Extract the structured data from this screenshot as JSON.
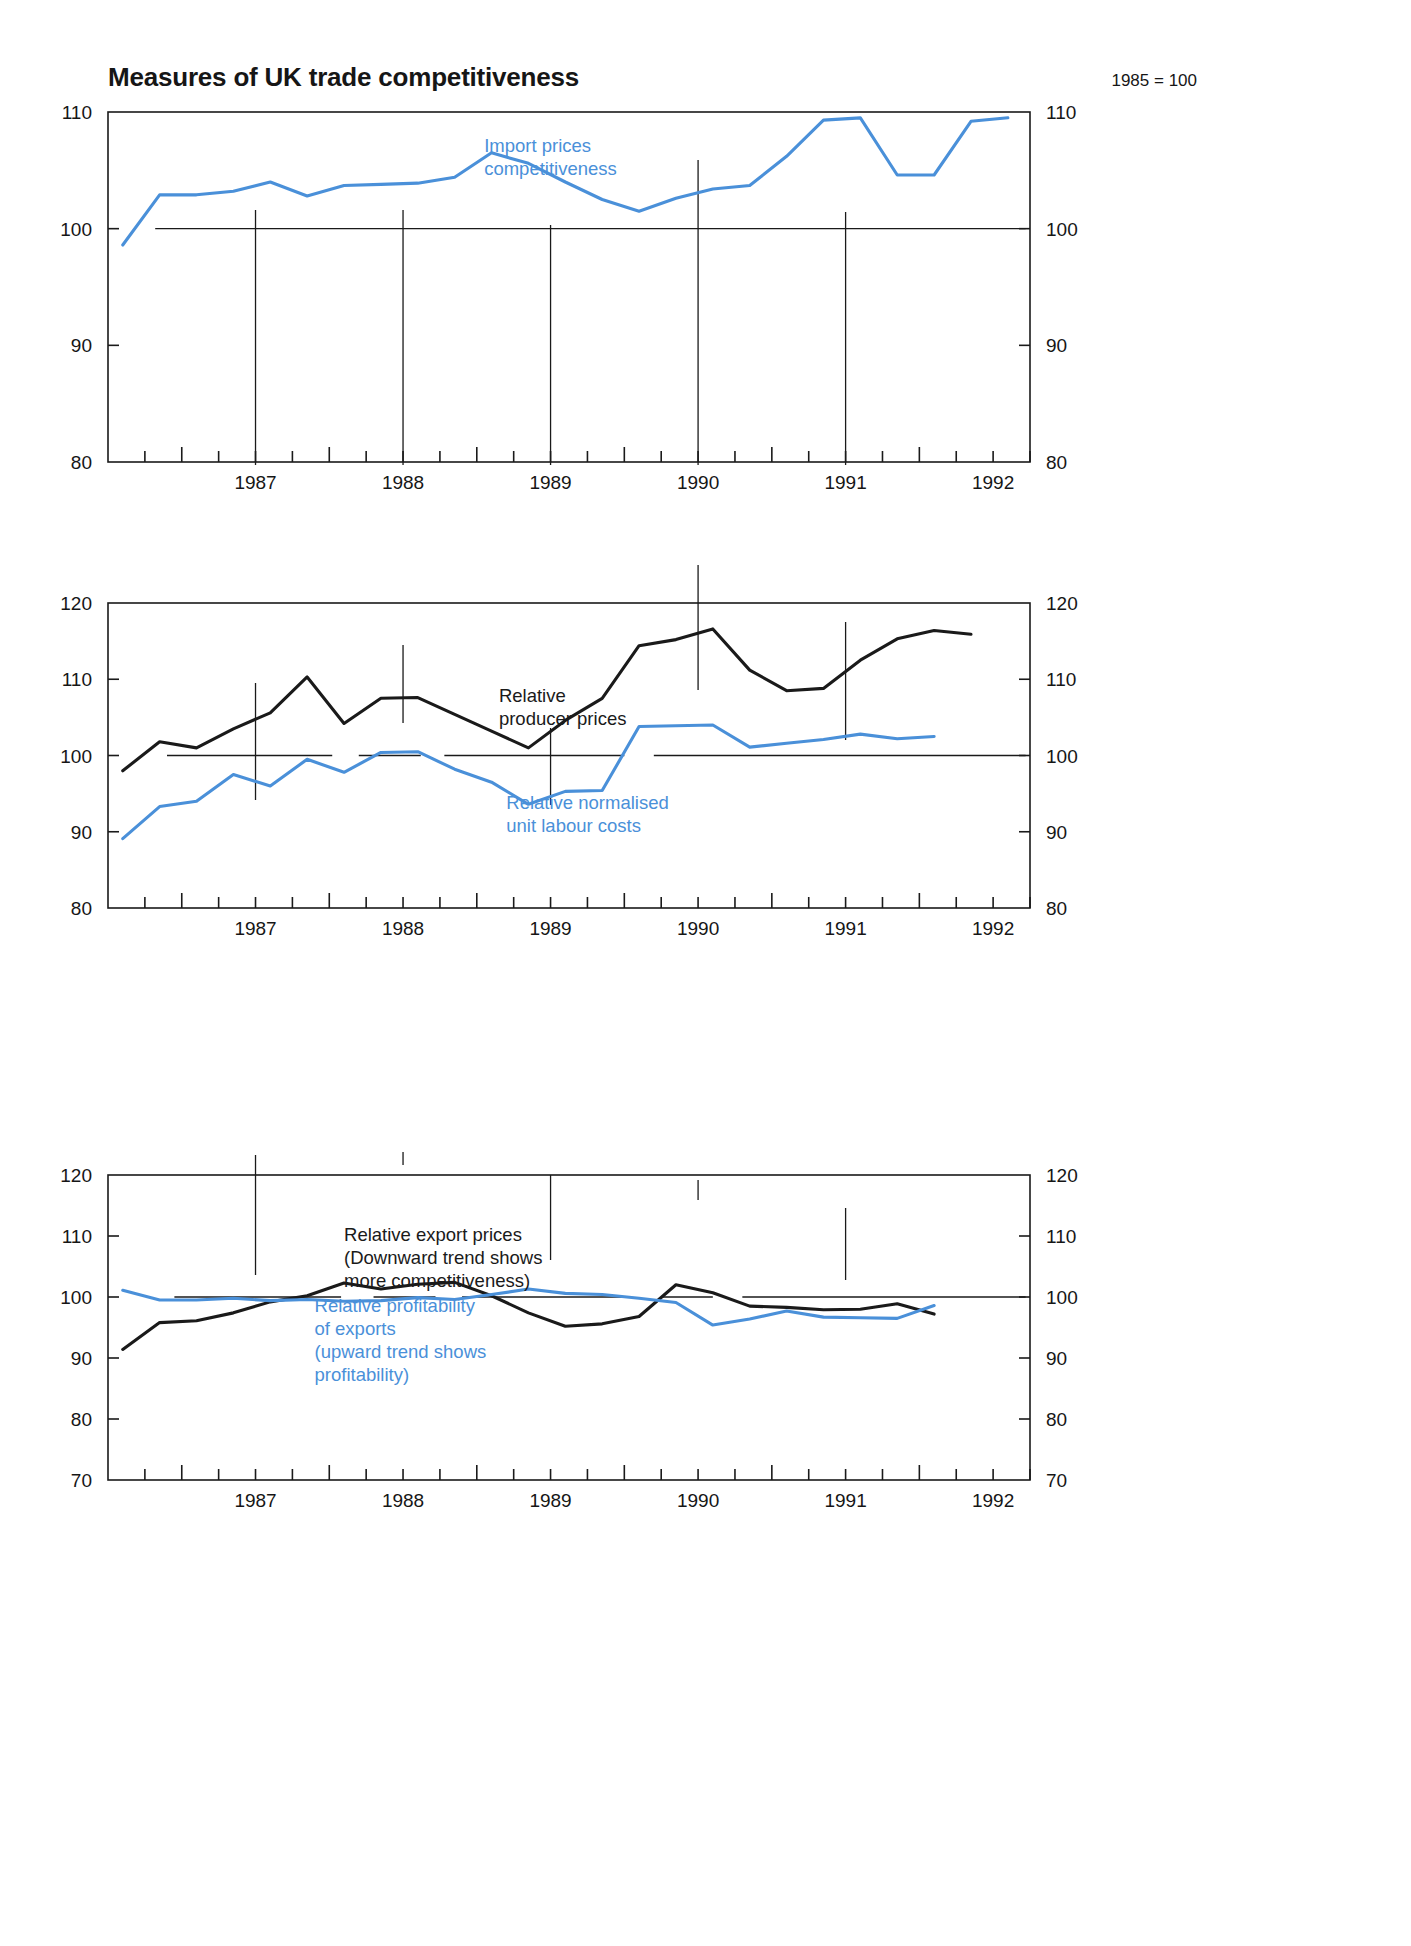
{
  "header": {
    "title": "Measures of UK trade competitiveness",
    "index_note": "1985 = 100"
  },
  "colors": {
    "blue": "#4a90d9",
    "black": "#1a1a1a",
    "frame": "#1a1a1a",
    "background": "#ffffff"
  },
  "chart_data": [
    {
      "type": "line",
      "panel": 1,
      "title": "Measures of UK trade competitiveness",
      "subtitle": "1985 = 100",
      "xlabel": "",
      "ylabel": "",
      "ylim": [
        80,
        110
      ],
      "yticks": [
        80,
        90,
        100,
        110
      ],
      "xlim": [
        1986.5,
        1992.75
      ],
      "xticks": [
        1987,
        1988,
        1989,
        1990,
        1991,
        1992
      ],
      "tick_labels": [
        "1987",
        "1988",
        "1989",
        "1990",
        "1991",
        "1992"
      ],
      "grid": false,
      "reference_line": 100,
      "legend_position": "inline",
      "annotations": [
        {
          "text": [
            "Import prices",
            "competitiveness"
          ],
          "color": "#4a90d9",
          "x": 1989.05,
          "y": 106.6
        }
      ],
      "series": [
        {
          "name": "Import prices competitiveness",
          "color": "#4a90d9",
          "x": [
            1986.6,
            1986.85,
            1987.1,
            1987.35,
            1987.6,
            1987.85,
            1988.1,
            1988.35,
            1988.6,
            1988.85,
            1989.1,
            1989.35,
            1989.6,
            1989.85,
            1990.1,
            1990.35,
            1990.6,
            1990.85,
            1991.1,
            1991.35,
            1991.6,
            1991.85,
            1992.1,
            1992.35,
            1992.6
          ],
          "values": [
            98.6,
            102.9,
            102.9,
            103.2,
            104.0,
            102.8,
            103.7,
            103.8,
            103.9,
            104.4,
            106.5,
            105.6,
            104.0,
            102.5,
            101.5,
            102.6,
            103.4,
            103.7,
            106.2,
            109.3,
            109.5,
            104.6,
            104.6,
            109.2,
            109.5,
            100.3
          ],
          "note": "quarterly-ish series, rises from 98.6 in 1986Q3 to ~109.5 peak, ends 100.3"
        }
      ]
    },
    {
      "type": "line",
      "panel": 2,
      "title": "",
      "xlabel": "",
      "ylabel": "",
      "ylim": [
        80,
        120
      ],
      "yticks": [
        80,
        90,
        100,
        110,
        120
      ],
      "xlim": [
        1986.5,
        1992.75
      ],
      "xticks": [
        1987,
        1988,
        1989,
        1990,
        1991,
        1992
      ],
      "tick_labels": [
        "1987",
        "1988",
        "1989",
        "1990",
        "1991",
        "1992"
      ],
      "grid": false,
      "reference_line": 100,
      "legend_position": "inline",
      "annotations": [
        {
          "text": [
            "Relative",
            "producer prices"
          ],
          "color": "#1a1a1a",
          "x": 1989.15,
          "y": 107.0
        },
        {
          "text": [
            "Relative normalised",
            "unit labour costs"
          ],
          "color": "#4a90d9",
          "x": 1989.2,
          "y": 93.0
        }
      ],
      "series": [
        {
          "name": "Relative producer prices",
          "color": "#1a1a1a",
          "x": [
            1986.6,
            1986.85,
            1987.1,
            1987.35,
            1987.6,
            1987.85,
            1988.1,
            1988.35,
            1988.6,
            1988.85,
            1989.1,
            1989.35,
            1989.6,
            1989.85,
            1990.1,
            1990.35,
            1990.6,
            1990.85,
            1991.1,
            1991.35,
            1991.6,
            1991.85,
            1992.1,
            1992.35,
            1992.6
          ],
          "values": [
            98.0,
            101.8,
            101.0,
            103.5,
            105.6,
            110.3,
            104.2,
            107.5,
            107.6,
            105.4,
            103.2,
            101.0,
            104.6,
            107.5,
            114.4,
            115.2,
            116.6,
            111.2,
            108.5,
            108.8,
            112.5,
            115.3,
            116.4,
            115.9
          ]
        },
        {
          "name": "Relative normalised unit labour costs",
          "color": "#4a90d9",
          "x": [
            1986.6,
            1986.85,
            1987.1,
            1987.35,
            1987.6,
            1987.85,
            1988.1,
            1988.35,
            1988.6,
            1988.85,
            1989.1,
            1989.35,
            1989.6,
            1989.85,
            1990.1,
            1990.35,
            1990.6,
            1990.85,
            1991.1,
            1991.35,
            1991.6,
            1991.85,
            1992.1,
            1992.35,
            1992.6
          ],
          "values": [
            89.1,
            93.3,
            94.0,
            97.5,
            96.0,
            99.5,
            97.8,
            100.4,
            100.5,
            98.2,
            96.5,
            93.6,
            95.3,
            95.4,
            103.8,
            103.9,
            104.0,
            101.1,
            101.6,
            102.1,
            102.8,
            102.2,
            102.5
          ]
        }
      ]
    },
    {
      "type": "line",
      "panel": 3,
      "title": "",
      "xlabel": "",
      "ylabel": "",
      "ylim": [
        70,
        120
      ],
      "yticks": [
        70,
        80,
        90,
        100,
        110,
        120
      ],
      "xlim": [
        1986.5,
        1992.75
      ],
      "xticks": [
        1987,
        1988,
        1989,
        1990,
        1991,
        1992
      ],
      "tick_labels": [
        "1987",
        "1988",
        "1989",
        "1990",
        "1991",
        "1992"
      ],
      "grid": false,
      "reference_line": 100,
      "legend_position": "inline",
      "annotations": [
        {
          "text": [
            "Relative export prices",
            "(Downward trend shows",
            "more competitiveness)"
          ],
          "color": "#1a1a1a",
          "x": 1988.1,
          "y": 109.2
        },
        {
          "text": [
            "Relative profitability",
            "of exports",
            "(upward trend shows",
            "profitability)"
          ],
          "color": "#4a90d9",
          "x": 1987.9,
          "y": 97.6
        }
      ],
      "series": [
        {
          "name": "Relative export prices",
          "color": "#1a1a1a",
          "x": [
            1986.6,
            1986.85,
            1987.1,
            1987.35,
            1987.6,
            1987.85,
            1988.1,
            1988.35,
            1988.6,
            1988.85,
            1989.1,
            1989.35,
            1989.6,
            1989.85,
            1990.1,
            1990.35,
            1990.6,
            1990.85,
            1991.1,
            1991.35,
            1991.6,
            1991.85,
            1992.1,
            1992.35,
            1992.6
          ],
          "values": [
            91.4,
            95.8,
            96.1,
            97.4,
            99.2,
            100.2,
            102.3,
            101.3,
            102.1,
            102.4,
            100.2,
            97.4,
            95.2,
            95.6,
            96.8,
            102.0,
            100.7,
            98.5,
            98.3,
            97.9,
            98.0,
            98.9,
            97.2
          ]
        },
        {
          "name": "Relative profitability of exports",
          "color": "#4a90d9",
          "x": [
            1986.6,
            1986.85,
            1987.1,
            1987.35,
            1987.6,
            1987.85,
            1988.1,
            1988.35,
            1988.6,
            1988.85,
            1989.1,
            1989.35,
            1989.6,
            1989.85,
            1990.1,
            1990.35,
            1990.6,
            1990.85,
            1991.1,
            1991.35,
            1991.6,
            1991.85,
            1992.1,
            1992.35,
            1992.6
          ],
          "values": [
            101.1,
            99.5,
            99.5,
            99.8,
            99.4,
            99.6,
            99.3,
            99.4,
            99.9,
            99.6,
            100.4,
            101.3,
            100.6,
            100.4,
            99.8,
            99.1,
            95.4,
            96.4,
            97.7,
            96.7,
            96.6,
            96.5,
            98.6
          ]
        }
      ]
    }
  ]
}
